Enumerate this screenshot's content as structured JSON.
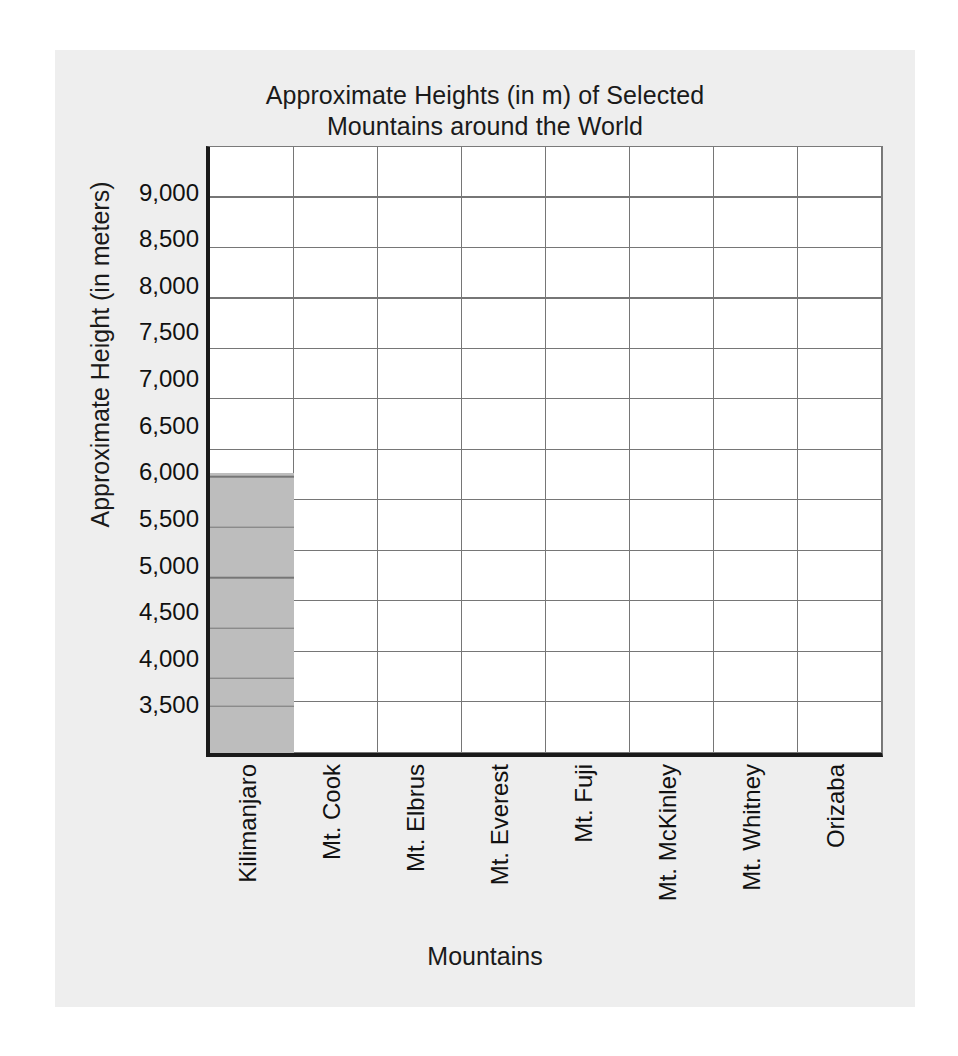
{
  "chart_data": {
    "type": "bar",
    "title": "Approximate Heights (in m) of Selected\nMountains around the World",
    "xlabel": "Mountains",
    "ylabel": "Approximate Height (in meters)",
    "categories": [
      "Kilimanjaro",
      "Mt. Cook",
      "Mt. Elbrus",
      "Mt. Everest",
      "Mt. Fuji",
      "Mt. McKinley",
      "Mt. Whitney",
      "Orizaba"
    ],
    "values": [
      6000,
      null,
      null,
      null,
      null,
      null,
      null,
      null
    ],
    "ytick_labels": [
      "9,000",
      "8,500",
      "8,000",
      "7,500",
      "7,000",
      "6,500",
      "6,000",
      "5,500",
      "5,000",
      "4,500",
      "4,000",
      "3,500"
    ],
    "ytick_values": [
      9000,
      8500,
      8000,
      7500,
      7000,
      6500,
      6000,
      5500,
      5000,
      4500,
      4000,
      3500
    ],
    "ylim": [
      3000,
      9500
    ],
    "xlim": [
      0,
      8
    ],
    "grid": true,
    "legend": "none",
    "bar_color": "#bdbdbd",
    "panel_color": "#eeeeee",
    "axis_color": "#1a1a1a",
    "gridline_color": "#767676"
  }
}
